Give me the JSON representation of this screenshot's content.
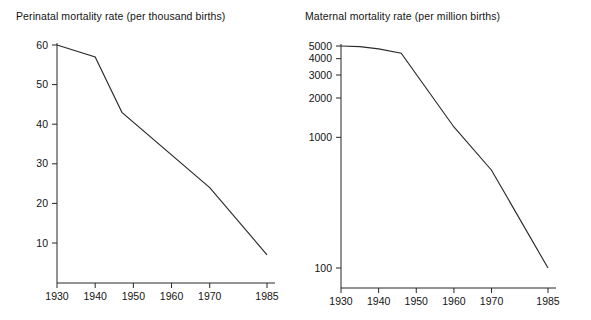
{
  "figure": {
    "width": 591,
    "height": 320,
    "background": "#ffffff",
    "line_color": "#2b2b2b",
    "axis_color": "#262626",
    "text_color": "#141414"
  },
  "chart_data": [
    {
      "type": "line",
      "id": "perinatal",
      "title": "Perinatal mortality rate (per thousand births)",
      "xlabel": "",
      "ylabel": "",
      "yscale": "linear",
      "xlim": [
        1930,
        1985
      ],
      "ylim": [
        0,
        62
      ],
      "grid": false,
      "legend": "none",
      "xticks": [
        1930,
        1940,
        1950,
        1960,
        1970,
        1985
      ],
      "xtick_labels": [
        "1930",
        "1940",
        "1950",
        "1960",
        "1970",
        "1985"
      ],
      "yticks": [
        10,
        20,
        30,
        40,
        50,
        60
      ],
      "ytick_labels": [
        "10",
        "20",
        "30",
        "40",
        "50",
        "60"
      ],
      "x": [
        1930,
        1940,
        1947,
        1970,
        1985
      ],
      "values": [
        60,
        57,
        43,
        24,
        7
      ],
      "series": [
        {
          "name": "Perinatal mortality rate",
          "points": [
            {
              "x": 1930,
              "y": 60
            },
            {
              "x": 1940,
              "y": 57
            },
            {
              "x": 1947,
              "y": 43
            },
            {
              "x": 1970,
              "y": 24
            },
            {
              "x": 1985,
              "y": 7
            }
          ]
        }
      ]
    },
    {
      "type": "line",
      "id": "maternal",
      "title": "Maternal mortality rate (per million births)",
      "xlabel": "",
      "ylabel": "",
      "yscale": "log",
      "xlim": [
        1930,
        1985
      ],
      "ylim": [
        85,
        5600
      ],
      "grid": false,
      "legend": "none",
      "xticks": [
        1930,
        1940,
        1950,
        1960,
        1970,
        1985
      ],
      "xtick_labels": [
        "1930",
        "1940",
        "1950",
        "1960",
        "1970",
        "1985"
      ],
      "yticks": [
        100,
        1000,
        2000,
        3000,
        4000,
        5000
      ],
      "ytick_labels": [
        "100",
        "1000",
        "2000",
        "3000",
        "4000",
        "5000"
      ],
      "x": [
        1930,
        1935,
        1940,
        1946,
        1960,
        1970,
        1985
      ],
      "values": [
        5000,
        4950,
        4750,
        4400,
        1200,
        560,
        100
      ],
      "series": [
        {
          "name": "Maternal mortality rate",
          "points": [
            {
              "x": 1930,
              "y": 5000
            },
            {
              "x": 1935,
              "y": 4950
            },
            {
              "x": 1940,
              "y": 4750
            },
            {
              "x": 1946,
              "y": 4400
            },
            {
              "x": 1960,
              "y": 1200
            },
            {
              "x": 1970,
              "y": 560
            },
            {
              "x": 1985,
              "y": 100
            }
          ]
        }
      ]
    }
  ]
}
